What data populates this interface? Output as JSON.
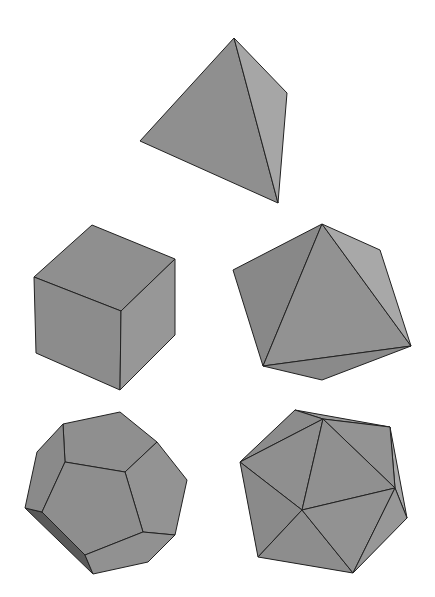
{
  "figure": {
    "title": "",
    "colors": {
      "background": "#ffffff",
      "face_mid": "#8f8f8f",
      "face_light": "#a6a6a6",
      "face_dark": "#5a5a5a",
      "edge": "#222222"
    }
  },
  "solids": [
    {
      "name": "Tetrahedron",
      "faces": 4
    },
    {
      "name": "Cube",
      "faces": 6
    },
    {
      "name": "Octahedron",
      "faces": 8
    },
    {
      "name": "Dodecahedron",
      "faces": 12
    },
    {
      "name": "Icosahedron",
      "faces": 20
    }
  ]
}
